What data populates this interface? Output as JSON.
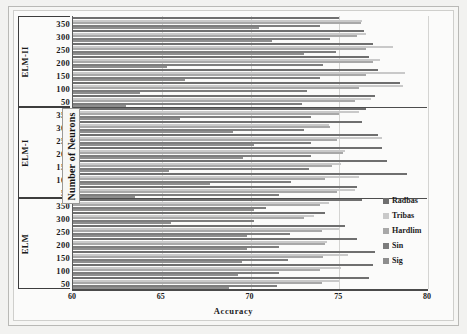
{
  "chart_data": {
    "type": "bar",
    "orientation": "horizontal",
    "title": "",
    "xlabel": "Accuracy",
    "ylabel": "Number of Neurons",
    "xlim": [
      60,
      80
    ],
    "xticks": [
      60,
      65,
      70,
      75,
      80
    ],
    "grid": true,
    "legend_position": "right",
    "legend": [
      "Radbas",
      "Tribas",
      "Hardlim",
      "Sin",
      "Sig"
    ],
    "group_labels": [
      "ELM-II",
      "ELM-I",
      "ELM"
    ],
    "categories": [
      350,
      300,
      250,
      200,
      150,
      100,
      50
    ],
    "groups": [
      {
        "name": "ELM-II",
        "categories": [
          350,
          300,
          250,
          200,
          150,
          100,
          50
        ],
        "series": [
          {
            "name": "Radbas",
            "values": [
              75.0,
              76.4,
              76.9,
              76.7,
              77.2,
              78.4,
              77.0
            ]
          },
          {
            "name": "Tribas",
            "values": [
              76.3,
              76.5,
              78.0,
              77.3,
              78.7,
              78.6,
              76.8
            ]
          },
          {
            "name": "Hardlim",
            "values": [
              76.2,
              76.0,
              76.5,
              76.9,
              76.5,
              76.1,
              75.9
            ]
          },
          {
            "name": "Sin",
            "values": [
              73.9,
              74.5,
              74.8,
              74.1,
              73.9,
              73.2,
              72.9
            ]
          },
          {
            "name": "Sig",
            "values": [
              70.5,
              71.2,
              73.0,
              65.3,
              66.3,
              63.8,
              63.0
            ]
          }
        ]
      },
      {
        "name": "ELM-I",
        "categories": [
          350,
          300,
          250,
          200,
          150,
          100,
          50
        ],
        "series": [
          {
            "name": "Radbas",
            "values": [
              76.5,
              76.3,
              77.2,
              77.4,
              77.7,
              78.8,
              76.0
            ]
          },
          {
            "name": "Tribas",
            "values": [
              76.1,
              74.4,
              77.4,
              75.3,
              75.1,
              76.1,
              75.9
            ]
          },
          {
            "name": "Hardlim",
            "values": [
              75.0,
              74.5,
              74.9,
              75.2,
              74.6,
              74.2,
              74.9
            ]
          },
          {
            "name": "Sin",
            "values": [
              73.4,
              73.0,
              73.4,
              73.4,
              73.3,
              72.3,
              71.6
            ]
          },
          {
            "name": "Sig",
            "values": [
              66.0,
              69.0,
              70.2,
              69.6,
              65.4,
              67.7,
              63.5
            ]
          }
        ]
      },
      {
        "name": "ELM",
        "categories": [
          350,
          300,
          250,
          200,
          150,
          100,
          50
        ],
        "series": [
          {
            "name": "Radbas",
            "values": [
              76.3,
              74.2,
              75.3,
              76.0,
              77.0,
              76.9,
              76.7
            ]
          },
          {
            "name": "Tribas",
            "values": [
              74.4,
              73.6,
              75.0,
              74.3,
              75.5,
              75.1,
              75.0
            ]
          },
          {
            "name": "Hardlim",
            "values": [
              73.9,
              73.0,
              74.0,
              74.2,
              74.1,
              73.9,
              74.0
            ]
          },
          {
            "name": "Sin",
            "values": [
              70.9,
              70.2,
              72.2,
              71.6,
              72.1,
              71.6,
              71.5
            ]
          },
          {
            "name": "Sig",
            "values": [
              70.2,
              65.5,
              69.8,
              69.8,
              69.5,
              69.3,
              68.8
            ]
          }
        ]
      }
    ],
    "series_colors": {
      "Radbas": "#6f6f6f",
      "Tribas": "#c9c9c9",
      "Hardlim": "#a8a8a8",
      "Sin": "#7d7d7d",
      "Sig": "#8e8e8e"
    }
  }
}
